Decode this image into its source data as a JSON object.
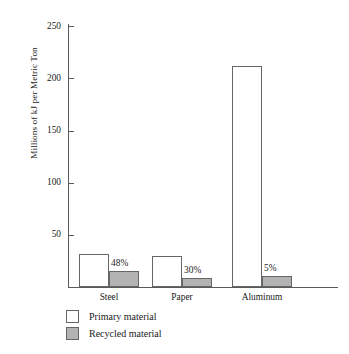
{
  "chart_data": {
    "type": "bar",
    "title": "",
    "subtitle": "",
    "xlabel": "",
    "ylabel": "Millions of kJ per Metric Ton",
    "categories": [
      "Steel",
      "Paper",
      "Aluminum"
    ],
    "ylim": [
      0,
      258
    ],
    "yticks": [
      50,
      100,
      150,
      200,
      250
    ],
    "ytick_labels": [
      "50",
      "100",
      "150",
      "200",
      "250"
    ],
    "grid": false,
    "legend_position": "bottom-left",
    "series": [
      {
        "name": "Primary material",
        "color": "#ffffff",
        "values": [
          32,
          30,
          212
        ]
      },
      {
        "name": "Recycled material",
        "color": "#b3b3b3",
        "values": [
          15,
          9,
          11
        ]
      }
    ],
    "annotations": [
      {
        "category": "Steel",
        "label": "48%"
      },
      {
        "category": "Paper",
        "label": "30%"
      },
      {
        "category": "Aluminum",
        "label": "5%"
      }
    ]
  },
  "legend": {
    "items": [
      {
        "label": "Primary material",
        "swatch": "primary"
      },
      {
        "label": "Recycled material",
        "swatch": "recycled"
      }
    ]
  },
  "colors": {
    "axis": "#5a5a5a",
    "bar_border": "#666666",
    "recycled_fill": "#b3b3b3",
    "primary_fill": "#ffffff",
    "text": "#1a1a1a"
  }
}
